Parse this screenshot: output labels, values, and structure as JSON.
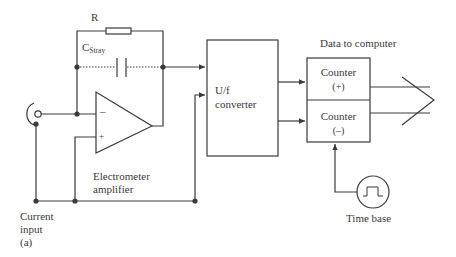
{
  "diagram": {
    "labels": {
      "resistor": "R",
      "stray_cap_main": "C",
      "stray_cap_sub": "Stray",
      "converter_line1": "U/f",
      "converter_line2": "converter",
      "data_to_computer": "Data to computer",
      "counter_plus_name": "Counter",
      "counter_plus_sign": "(+)",
      "counter_minus_name": "Counter",
      "counter_minus_sign": "(–)",
      "amplifier_line1": "Electrometer",
      "amplifier_line2": "amplifier",
      "input_line1": "Current",
      "input_line2": "input",
      "input_line3": "(a)",
      "time_base": "Time base",
      "opamp_minus": "–",
      "opamp_plus": "+"
    },
    "colors": {
      "line": "#3a3a3a",
      "node": "#3a3a3a",
      "background": "#ffffff"
    }
  }
}
